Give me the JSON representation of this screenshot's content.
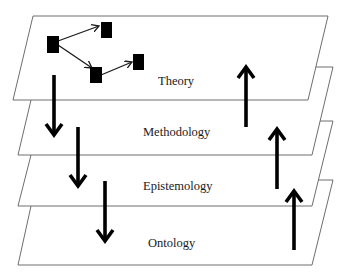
{
  "diagram": {
    "layers": [
      {
        "id": "theory",
        "label": "Theory"
      },
      {
        "id": "methodology",
        "label": "Methodology"
      },
      {
        "id": "epistemology",
        "label": "Epistemology"
      },
      {
        "id": "ontology",
        "label": "Ontology"
      }
    ],
    "network": {
      "nodes": [
        "n1",
        "n2",
        "n3",
        "n4"
      ],
      "edges": [
        {
          "from": "n1",
          "to": "n2"
        },
        {
          "from": "n1",
          "to": "n3"
        },
        {
          "from": "n3",
          "to": "n4"
        }
      ]
    },
    "downward_arrows": 3,
    "upward_arrows": 3,
    "colors": {
      "plane_stroke": "#6e6e6e",
      "arrow": "#000000",
      "text": "#1a1a1a"
    }
  }
}
